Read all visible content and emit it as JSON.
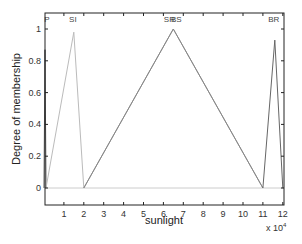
{
  "chart_data": {
    "type": "line",
    "title": "",
    "xlabel": "sunlight",
    "ylabel": "Degree of membership",
    "x_exponent_label": "x 10",
    "x_exponent_power": "4",
    "xlim": [
      0,
      12
    ],
    "ylim": [
      -0.1,
      1.1
    ],
    "x_ticks": [
      1,
      2,
      3,
      4,
      5,
      6,
      7,
      8,
      9,
      10,
      11,
      12
    ],
    "y_ticks": [
      0,
      0.2,
      0.4,
      0.6,
      0.8,
      1
    ],
    "y_tick_labels": [
      "0",
      "0.2",
      "0.4",
      "0.6",
      "0.8",
      "1"
    ],
    "grid": false,
    "legend": "none",
    "series": [
      {
        "name": "P",
        "color": "#555555",
        "x": [
          0,
          0.05,
          0.1
        ],
        "y": [
          0,
          0.87,
          0
        ],
        "label_x": 0.15
      },
      {
        "name": "SI",
        "color": "#bbbbbb",
        "x": [
          0.1,
          1.5,
          2.0
        ],
        "y": [
          0,
          0.98,
          0
        ],
        "label_x": 1.45
      },
      {
        "name": "SR",
        "color": "#999999",
        "x": [
          2.0,
          6.5,
          11.0
        ],
        "y": [
          0,
          1.0,
          0
        ],
        "label_x": 6.3
      },
      {
        "name": "BS",
        "color": "#888888",
        "x": [
          2.0,
          6.5,
          11.0
        ],
        "y": [
          0,
          1.0,
          0
        ],
        "label_x": 6.65
      },
      {
        "name": "BR",
        "color": "#666666",
        "x": [
          11.0,
          11.6,
          12.0
        ],
        "y": [
          0,
          0.93,
          0
        ],
        "label_x": 11.55
      }
    ],
    "baseline": {
      "y": 0,
      "color": "#cccccc"
    }
  }
}
